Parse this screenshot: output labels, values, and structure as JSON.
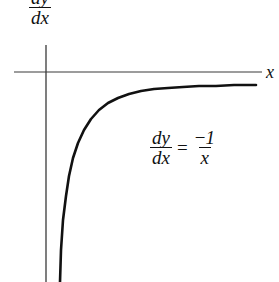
{
  "figure": {
    "background_color": "#ffffff",
    "ink_color": "#111111",
    "axis_color": "#3a3a3a",
    "width": 279,
    "height": 282
  },
  "axes": {
    "x_axis": {
      "label": "x",
      "label_name": "x-axis-label",
      "y_pixel": 72,
      "x_start": 14,
      "x_end": 262
    },
    "y_axis": {
      "label_numerator": "dy",
      "label_denominator": "dx",
      "label_name": "y-axis-label",
      "x_pixel": 46,
      "y_start": 45,
      "y_end": 282
    }
  },
  "equation": {
    "left_numerator": "dy",
    "left_denominator": "dx",
    "equals": "=",
    "right_numerator_sign": "−",
    "right_numerator_value": "1",
    "right_denominator": "x",
    "plain_text": "dy/dx = -1/x"
  },
  "chart_data": {
    "type": "line",
    "title": "",
    "xlabel": "x",
    "ylabel": "dy/dx",
    "grid": false,
    "legend": false,
    "annotations": [
      {
        "text": "dy/dx = -1/x",
        "x_pixel": 150,
        "y_pixel": 128
      }
    ],
    "axis_origin_pixel": [
      46,
      72
    ],
    "series": [
      {
        "name": "dy/dx = -1/x",
        "stroke_width": 2.6,
        "color": "#111111",
        "points_pixel": [
          [
            60,
            282
          ],
          [
            61,
            250
          ],
          [
            63,
            220
          ],
          [
            66,
            196
          ],
          [
            69,
            176
          ],
          [
            73,
            158
          ],
          [
            78,
            143
          ],
          [
            84,
            130
          ],
          [
            91,
            119
          ],
          [
            99,
            110
          ],
          [
            108,
            103
          ],
          [
            118,
            98
          ],
          [
            129,
            94
          ],
          [
            141,
            91
          ],
          [
            154,
            89
          ],
          [
            168,
            88
          ],
          [
            183,
            87
          ],
          [
            199,
            86
          ],
          [
            216,
            86
          ],
          [
            234,
            85
          ],
          [
            256,
            85
          ]
        ]
      }
    ]
  }
}
